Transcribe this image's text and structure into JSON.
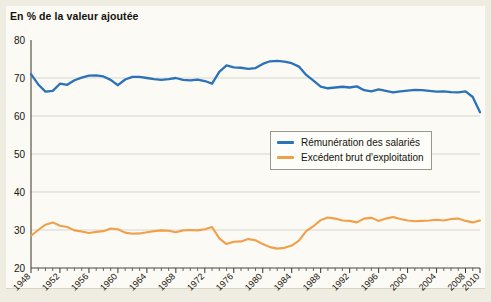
{
  "chart_data": {
    "type": "line",
    "title": "En % de la valeur ajoutée",
    "xlabel": "",
    "ylabel": "",
    "xlim": [
      1948,
      2010
    ],
    "ylim": [
      20,
      80
    ],
    "yticks": [
      20,
      30,
      40,
      50,
      60,
      70,
      80
    ],
    "xticks": [
      1948,
      1952,
      1956,
      1960,
      1964,
      1968,
      1972,
      1976,
      1980,
      1984,
      1988,
      1992,
      1996,
      2000,
      2004,
      2008,
      2010
    ],
    "xtick_labels": [
      "1948",
      "1952",
      "1956",
      "1960",
      "1964",
      "1968",
      "1972",
      "1976",
      "1980",
      "1984",
      "1988",
      "1992",
      "1996",
      "2000",
      "2004",
      "2008",
      "2010"
    ],
    "minor_xtick_step": 1,
    "grid": "horizontal",
    "legend_position": "center-right-inside",
    "x": [
      1948,
      1949,
      1950,
      1951,
      1952,
      1953,
      1954,
      1955,
      1956,
      1957,
      1958,
      1959,
      1960,
      1961,
      1962,
      1963,
      1964,
      1965,
      1966,
      1967,
      1968,
      1969,
      1970,
      1971,
      1972,
      1973,
      1974,
      1975,
      1976,
      1977,
      1978,
      1979,
      1980,
      1981,
      1982,
      1983,
      1984,
      1985,
      1986,
      1987,
      1988,
      1989,
      1990,
      1991,
      1992,
      1993,
      1994,
      1995,
      1996,
      1997,
      1998,
      1999,
      2000,
      2001,
      2002,
      2003,
      2004,
      2005,
      2006,
      2007,
      2008,
      2009,
      2010
    ],
    "series": [
      {
        "name": "Rémunération des salariés",
        "color": "#2b72b8",
        "values": [
          71.0,
          68.3,
          66.4,
          66.6,
          68.5,
          68.2,
          69.4,
          70.1,
          70.6,
          70.7,
          70.4,
          69.5,
          68.1,
          69.6,
          70.3,
          70.3,
          70.0,
          69.7,
          69.5,
          69.7,
          70.0,
          69.5,
          69.4,
          69.6,
          69.2,
          68.5,
          71.6,
          73.3,
          72.8,
          72.7,
          72.4,
          72.6,
          73.7,
          74.4,
          74.5,
          74.3,
          73.9,
          73.0,
          70.8,
          69.3,
          67.7,
          67.3,
          67.5,
          67.7,
          67.5,
          67.8,
          66.8,
          66.5,
          67.0,
          66.6,
          66.2,
          66.5,
          66.7,
          66.9,
          66.8,
          66.6,
          66.4,
          66.5,
          66.3,
          66.2,
          66.5,
          65.0,
          61.0
        ]
      },
      {
        "name": "Excédent brut d'exploitation",
        "color": "#f0a04a",
        "values": [
          28.5,
          30.0,
          31.4,
          32.0,
          31.1,
          30.8,
          29.9,
          29.6,
          29.2,
          29.5,
          29.7,
          30.4,
          30.2,
          29.3,
          29.0,
          29.1,
          29.4,
          29.7,
          29.9,
          29.8,
          29.4,
          29.9,
          30.0,
          29.9,
          30.2,
          30.8,
          27.8,
          26.3,
          26.9,
          27.0,
          27.6,
          27.3,
          26.3,
          25.5,
          25.1,
          25.3,
          25.9,
          27.2,
          29.7,
          31.0,
          32.6,
          33.3,
          33.0,
          32.5,
          32.4,
          32.0,
          33.0,
          33.2,
          32.4,
          33.0,
          33.4,
          32.9,
          32.5,
          32.3,
          32.4,
          32.5,
          32.7,
          32.5,
          32.9,
          33.0,
          32.4,
          32.0,
          32.5
        ]
      }
    ]
  },
  "legend": {
    "items": [
      {
        "label": "Rémunération des salariés",
        "color": "#2b72b8"
      },
      {
        "label": "Excédent brut d'exploitation",
        "color": "#f0a04a"
      }
    ]
  }
}
